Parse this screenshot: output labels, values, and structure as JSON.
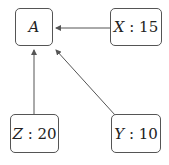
{
  "diagram": {
    "nodes": [
      {
        "id": "A",
        "name": "A",
        "value": null,
        "label": "A"
      },
      {
        "id": "X",
        "name": "X",
        "value": 15,
        "label_name": "X",
        "label_sep": " : ",
        "label_value": "15"
      },
      {
        "id": "Z",
        "name": "Z",
        "value": 20,
        "label_name": "Z",
        "label_sep": " : ",
        "label_value": "20"
      },
      {
        "id": "Y",
        "name": "Y",
        "value": 10,
        "label_name": "Y",
        "label_sep": " : ",
        "label_value": "10"
      }
    ],
    "edges": [
      {
        "from": "X",
        "to": "A"
      },
      {
        "from": "Z",
        "to": "A"
      },
      {
        "from": "Y",
        "to": "A"
      }
    ],
    "colors": {
      "stroke": "#555555",
      "text": "#222222",
      "background": "#ffffff"
    }
  }
}
